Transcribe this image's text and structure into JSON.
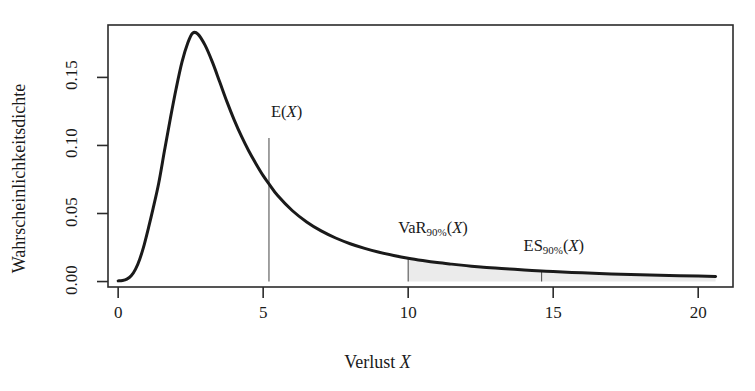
{
  "chart_data": {
    "type": "line",
    "title": "",
    "xlabel": "Verlust X",
    "ylabel": "Wahrscheinlichkeitsdichte",
    "xlim": [
      -0.35,
      21.2
    ],
    "ylim": [
      -0.004,
      0.1885
    ],
    "grid": false,
    "legend": null,
    "x_ticks": [
      0,
      5,
      10,
      15,
      20
    ],
    "x_tick_labels": [
      "0",
      "5",
      "10",
      "15",
      "20"
    ],
    "y_ticks": [
      0.0,
      0.05,
      0.1,
      0.15
    ],
    "y_tick_labels": [
      "0.00",
      "0.05",
      "0.10",
      "0.15"
    ],
    "series": [
      {
        "name": "Wahrscheinlichkeitsdichte",
        "color": "#1a1a1a",
        "x": [
          0.0,
          0.15,
          0.3,
          0.45,
          0.6,
          0.75,
          0.9,
          1.05,
          1.2,
          1.4,
          1.6,
          1.8,
          2.0,
          2.2,
          2.4,
          2.57,
          2.75,
          3.0,
          3.25,
          3.5,
          3.75,
          4.0,
          4.25,
          4.5,
          4.75,
          5.0,
          5.2,
          5.5,
          6.0,
          6.5,
          7.0,
          7.5,
          8.0,
          8.5,
          9.0,
          9.5,
          10.0,
          10.5,
          11.0,
          11.5,
          12.0,
          12.5,
          13.0,
          13.5,
          14.0,
          14.6,
          15.0,
          16.0,
          17.0,
          18.0,
          19.0,
          20.0,
          20.6
        ],
        "y": [
          0.0005,
          0.0008,
          0.0018,
          0.0042,
          0.0091,
          0.0168,
          0.0272,
          0.0398,
          0.0532,
          0.0724,
          0.0964,
          0.1198,
          0.1418,
          0.1612,
          0.1752,
          0.1825,
          0.1818,
          0.1735,
          0.1612,
          0.1468,
          0.1322,
          0.1188,
          0.1068,
          0.0961,
          0.0866,
          0.0778,
          0.0718,
          0.0632,
          0.0522,
          0.0438,
          0.0372,
          0.032,
          0.0278,
          0.0244,
          0.0215,
          0.0192,
          0.0172,
          0.0155,
          0.014,
          0.0128,
          0.0117,
          0.0107,
          0.0099,
          0.0092,
          0.0085,
          0.0078,
          0.0074,
          0.0064,
          0.0056,
          0.005,
          0.0045,
          0.0041,
          0.0038
        ]
      }
    ],
    "annotations": [
      {
        "id": "expected-loss",
        "label_text": "E(X)",
        "label_base": "E(",
        "label_sub": "",
        "label_tail": "X)",
        "x": 5.2,
        "y_top": 0.1055,
        "line_from_y": 0.0,
        "line_to_y": 0.1055
      },
      {
        "id": "value-at-risk",
        "label_text": "VaR90%(X)",
        "label_base": "VaR",
        "label_sub": "90%",
        "label_tail": "(X)",
        "x": 10.0,
        "y_top": 0.0172,
        "line_from_y": 0.0,
        "line_to_y": 0.0172
      },
      {
        "id": "expected-shortfall",
        "label_text": "ES90%(X)",
        "label_base": "ES",
        "label_sub": "90%",
        "label_tail": "(X)",
        "x": 14.6,
        "y_top": 0.0078,
        "line_from_y": 0.0,
        "line_to_y": 0.0078
      }
    ],
    "shaded_region": {
      "name": "tail-beyond-var",
      "from_x": 10.0,
      "to_x": 20.6,
      "color": "#ebebeb"
    }
  },
  "axes": {
    "y_label": "Wahrscheinlichkeitsdichte",
    "x_label_text": "Verlust ",
    "x_label_var": "X",
    "y_tick_labels": [
      "0.00",
      "0.05",
      "0.10",
      "0.15"
    ],
    "x_tick_labels": [
      "0",
      "5",
      "10",
      "15",
      "20"
    ]
  },
  "annotation_labels": {
    "expected": {
      "base": "E(",
      "sub": "",
      "tail": "X",
      "close": ")"
    },
    "var": {
      "base": "VaR",
      "sub": "90%",
      "tail": "X",
      "close": ")",
      "open": "("
    },
    "es": {
      "base": "ES",
      "sub": "90%",
      "tail": "X",
      "close": ")",
      "open": "("
    }
  },
  "colors": {
    "curve": "#1a1a1a",
    "frame": "#2b2b2b",
    "shade": "#ececec",
    "background": "#ffffff",
    "annotation_line": "#555555"
  }
}
